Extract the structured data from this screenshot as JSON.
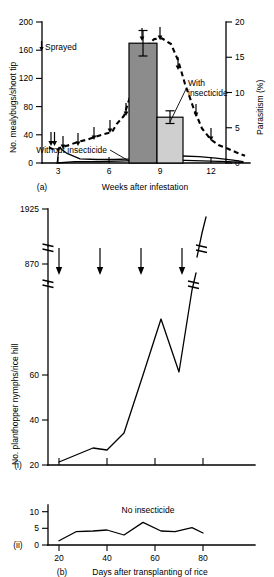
{
  "figure": {
    "panel_a_label": "(a)",
    "panel_b_label": "(b)",
    "panel_b_sub_i": "(i)",
    "panel_b_sub_ii": "(ii)"
  },
  "panel_a": {
    "ylabel_left": "No. mealybugs/shoot tip",
    "ylabel_right": "Parasitism (%)",
    "xlabel": "Weeks after infestation",
    "legend_sprayed": "Sprayed",
    "annot_with": "With",
    "annot_with2": "insecticide",
    "annot_without": "Without insecticide",
    "yticks_left": [
      "0",
      "40",
      "80",
      "120",
      "160",
      "200"
    ],
    "yticks_right": [
      "0",
      "5",
      "10",
      "15",
      "20"
    ],
    "xticks": [
      "3",
      "6",
      "9",
      "12"
    ]
  },
  "panel_b": {
    "ylabel": "No. planthopper nymphs/rice hill",
    "xlabel": "Days after transplanting of rice",
    "annot_no_insecticide": "No insecticide",
    "yticks_i": [
      "0",
      "20",
      "40",
      "60",
      "870",
      "1925"
    ],
    "yticks_ii": [
      "0",
      "5",
      "10"
    ],
    "xticks": [
      "20",
      "40",
      "60",
      "80"
    ]
  },
  "chart_data": [
    {
      "type": "line",
      "id": "panel-a",
      "title": "",
      "xlabel": "Weeks after infestation",
      "ylabel": "No. mealybugs/shoot tip",
      "ylabel_secondary": "Parasitism (%)",
      "xlim": [
        2.0,
        14.2
      ],
      "ylim": [
        0,
        215
      ],
      "ylim_secondary": [
        0,
        20
      ],
      "xticks": [
        3,
        6,
        9,
        12
      ],
      "yticks": [
        0,
        40,
        80,
        120,
        160,
        200
      ],
      "yticks_secondary": [
        0,
        5,
        10,
        15,
        20
      ],
      "grid": false,
      "legend": [
        "Sprayed"
      ],
      "annotations": [
        {
          "text": "Sprayed",
          "type": "legend-arrow"
        },
        {
          "text": "With insecticide",
          "points_to": "light-bar"
        },
        {
          "text": "Without insecticide",
          "points_to": "dark-bar"
        }
      ],
      "series": [
        {
          "name": "Parasitism (%) - dashed",
          "axis": "secondary",
          "style": "dashed",
          "x": [
            2.5,
            2.9,
            3.2,
            3.7,
            4.2,
            4.7,
            5.2,
            5.7,
            6.2,
            6.5,
            6.9,
            7.3,
            7.7,
            8.1,
            8.6,
            9.1,
            9.6,
            10.0,
            10.4,
            10.9,
            11.4,
            11.9,
            12.4,
            12.9,
            13.4,
            13.9
          ],
          "y": [
            2.2,
            1.8,
            2.2,
            2.6,
            3.0,
            3.3,
            3.7,
            4.1,
            4.4,
            5.6,
            6.7,
            9.8,
            13.5,
            16.2,
            17.6,
            17.7,
            16.9,
            14.6,
            11.2,
            7.6,
            4.9,
            3.3,
            2.5,
            2.0,
            1.5,
            1.0
          ]
        },
        {
          "name": "Mealybugs with insecticide - solid",
          "axis": "primary",
          "style": "solid",
          "x": [
            2.95,
            3.15,
            3.6,
            4.4,
            5.4,
            6.4,
            7.4,
            8.4,
            9.4,
            10.4,
            11.4,
            12.4,
            13.4,
            14.0
          ],
          "y": [
            0,
            22,
            14,
            6,
            5,
            5,
            6,
            8,
            10,
            10,
            9,
            7,
            4,
            2
          ]
        },
        {
          "name": "Mealybugs without insecticide - solid baseline",
          "axis": "primary",
          "style": "solid",
          "x": [
            2.95,
            4.0,
            5.5,
            7.0,
            8.5,
            10.0,
            11.5,
            13.0,
            14.0
          ],
          "y": [
            0,
            2,
            2,
            3,
            4,
            4,
            3,
            2,
            1
          ]
        }
      ],
      "bars": [
        {
          "label": "Without insecticide",
          "value": 170,
          "error": 18,
          "color": "#8c8c8c",
          "x_center": 8.45
        },
        {
          "label": "With insecticide",
          "value": 65,
          "error": 9,
          "color": "#cfcfcf",
          "x_center": 9.75
        }
      ],
      "spray_arrows_x": [
        2.6,
        2.78,
        3.3,
        4.2,
        5.15,
        6.1,
        7.05,
        8.0,
        8.95,
        9.9,
        10.85,
        11.8
      ]
    },
    {
      "type": "line",
      "id": "panel-b-i",
      "title": "",
      "xlabel": "",
      "ylabel": "No. planthopper nymphs/rice hill",
      "xlim": [
        14,
        92
      ],
      "ylim": [
        0,
        1925
      ],
      "broken_axis": true,
      "axis_breaks": [
        [
          68,
          800
        ],
        [
          940,
          1700
        ]
      ],
      "xticks": [
        20,
        40,
        60,
        80
      ],
      "yticks": [
        0,
        20,
        40,
        60,
        870,
        1925
      ],
      "grid": false,
      "spray_arrows_x": [
        23,
        36,
        48,
        60
      ],
      "series": [
        {
          "name": "Insecticide-treated planthopper nymphs",
          "style": "solid",
          "x": [
            20,
            27,
            34,
            40,
            47,
            55,
            62,
            69,
            76,
            82
          ],
          "y": [
            1,
            4,
            7,
            6,
            13,
            40,
            65,
            41,
            870,
            1925
          ]
        }
      ]
    },
    {
      "type": "line",
      "id": "panel-b-ii",
      "title": "",
      "xlabel": "Days after transplanting of rice",
      "ylabel": "",
      "xlim": [
        14,
        92
      ],
      "ylim": [
        0,
        12
      ],
      "xticks": [
        20,
        40,
        60,
        80
      ],
      "yticks": [
        0,
        5,
        10
      ],
      "grid": false,
      "annotations": [
        {
          "text": "No insecticide"
        }
      ],
      "series": [
        {
          "name": "No insecticide planthopper nymphs",
          "style": "solid",
          "x": [
            20,
            27,
            34,
            40,
            47,
            55,
            62,
            68,
            75,
            80
          ],
          "y": [
            1.3,
            4.0,
            4.2,
            4.5,
            3.0,
            6.8,
            4.2,
            4.0,
            5.2,
            3.6
          ]
        }
      ]
    }
  ]
}
